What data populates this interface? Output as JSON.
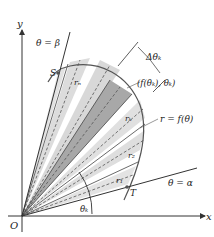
{
  "diagram": {
    "labels": {
      "y_axis": "y",
      "x_axis": "x",
      "origin": "O",
      "beta_ray": "θ = β",
      "alpha_ray": "θ = α",
      "point_S": "S",
      "point_T": "T",
      "r_n": "rₙ",
      "r_k": "rₖ",
      "r_2": "r₂",
      "r_1": "r₁",
      "delta_theta": "Δθₖ",
      "point_k": "(f(θₖ), θₖ)",
      "curve": "r = f(θ)",
      "theta_k": "θₖ"
    },
    "colors": {
      "light_sector": "#d9d9d9",
      "dark_sector": "#9a9a9a",
      "lines": "#333333",
      "curve": "#555555"
    }
  }
}
